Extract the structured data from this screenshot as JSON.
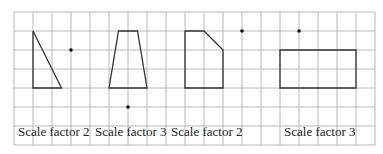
{
  "grid": {
    "origin_x": 14,
    "origin_y": 12,
    "cell": 19,
    "cols": 19,
    "rows": 7,
    "line_color": "#b8b8b8"
  },
  "shapes": [
    {
      "name": "triangle",
      "points": [
        [
          1,
          1
        ],
        [
          1,
          4
        ],
        [
          2.5,
          4
        ]
      ],
      "centre": [
        3,
        2
      ]
    },
    {
      "name": "trapezium",
      "points": [
        [
          5.5,
          1
        ],
        [
          6.5,
          1
        ],
        [
          7,
          4
        ],
        [
          5,
          4
        ]
      ],
      "centre": [
        6,
        5
      ]
    },
    {
      "name": "pentagon",
      "points": [
        [
          9,
          1
        ],
        [
          10,
          1
        ],
        [
          11,
          2
        ],
        [
          11,
          4
        ],
        [
          9,
          4
        ]
      ],
      "centre": [
        12,
        1
      ]
    },
    {
      "name": "rectangle",
      "points": [
        [
          14,
          2
        ],
        [
          18,
          2
        ],
        [
          18,
          4
        ],
        [
          14,
          4
        ]
      ],
      "centre": [
        15,
        1
      ]
    }
  ],
  "labels": [
    {
      "text": "Scale factor 2",
      "x": 18,
      "y": 136
    },
    {
      "text": "Scale factor 3",
      "x": 95,
      "y": 136
    },
    {
      "text": "Scale factor 2",
      "x": 171,
      "y": 136
    },
    {
      "text": "Scale factor 3",
      "x": 284,
      "y": 136
    }
  ],
  "colors": {
    "shape_stroke": "#333333",
    "dot": "#111111",
    "text": "#222222"
  }
}
